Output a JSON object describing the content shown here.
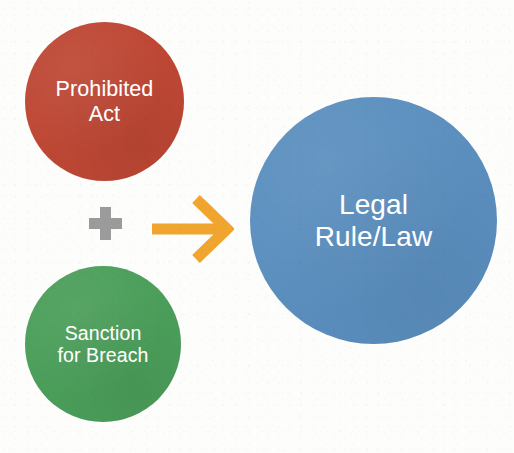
{
  "diagram": {
    "type": "concept-diagram",
    "background_color": "#fdfdfb",
    "title_visible": false,
    "nodes": [
      {
        "id": "prohibited-act",
        "label": "Prohibited\nAct",
        "shape": "circle",
        "color": "#be4734",
        "text_color": "#ffffff",
        "role": "input",
        "center": [
          104,
          102
        ],
        "diameter": 159
      },
      {
        "id": "sanction-for-breach",
        "label": "Sanction\nfor Breach",
        "shape": "circle",
        "color": "#4b9e5a",
        "text_color": "#ffffff",
        "role": "input",
        "center": [
          103,
          344
        ],
        "diameter": 156
      },
      {
        "id": "legal-rule-law",
        "label": "Legal\nRule/Law",
        "shape": "circle",
        "color": "#5b8fbf",
        "text_color": "#ffffff",
        "role": "output",
        "center": [
          374,
          221
        ],
        "diameter": 247
      }
    ],
    "connectors": [
      {
        "id": "plus-operator",
        "glyph": "plus-icon",
        "symbol": "+",
        "color": "#9b9b9b",
        "meaning": "combine"
      },
      {
        "id": "result-arrow",
        "glyph": "arrow-right-icon",
        "symbol": "→",
        "color": "#f0a52e",
        "meaning": "equals / produces",
        "from": [
          "prohibited-act",
          "sanction-for-breach"
        ],
        "to": "legal-rule-law"
      }
    ],
    "equation": "Prohibited Act + Sanction for Breach → Legal Rule/Law"
  }
}
